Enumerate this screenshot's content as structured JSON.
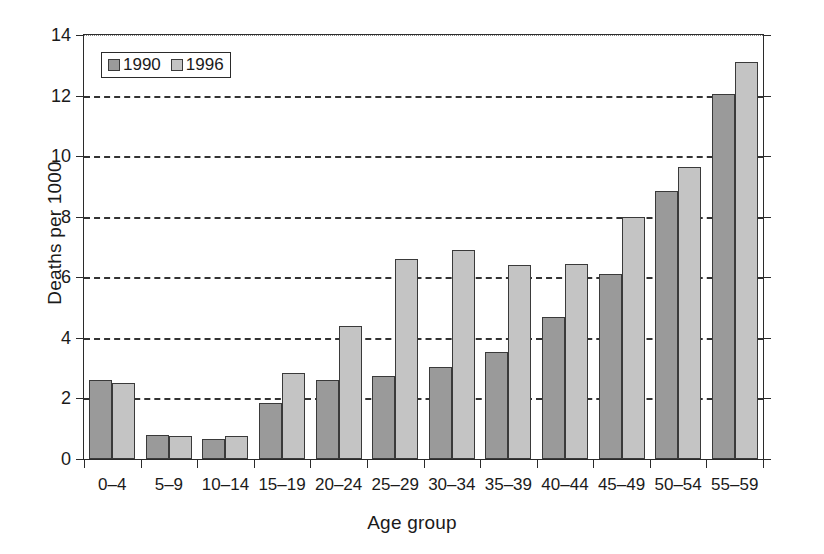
{
  "chart_data": {
    "type": "bar",
    "title": "",
    "xlabel": "Age group",
    "ylabel": "Deaths per 1000",
    "ylim": [
      0,
      14
    ],
    "ytick_values": [
      0,
      2,
      4,
      6,
      8,
      10,
      12,
      14
    ],
    "ytick_labels": [
      "0",
      "2",
      "4",
      "6",
      "8",
      "10",
      "12",
      "14"
    ],
    "grid": "horizontal-dashed",
    "legend_position": "upper-left-inside",
    "categories": [
      "0–4",
      "5–9",
      "10–14",
      "15–19",
      "20–24",
      "25–29",
      "30–34",
      "35–39",
      "40–44",
      "45–49",
      "50–54",
      "55–59"
    ],
    "series": [
      {
        "name": "1990",
        "color": "#9a9a9a",
        "values": [
          2.6,
          0.8,
          0.65,
          1.85,
          2.6,
          2.75,
          3.05,
          3.55,
          4.7,
          6.1,
          8.85,
          12.05
        ]
      },
      {
        "name": "1996",
        "color": "#c4c4c4",
        "values": [
          2.5,
          0.75,
          0.75,
          2.85,
          4.4,
          6.6,
          6.9,
          6.4,
          6.45,
          8.0,
          9.65,
          13.1
        ]
      }
    ]
  },
  "legend": {
    "entries": [
      {
        "label": "1990",
        "swatch_class": "s1990"
      },
      {
        "label": "1996",
        "swatch_class": "s1996"
      }
    ]
  }
}
